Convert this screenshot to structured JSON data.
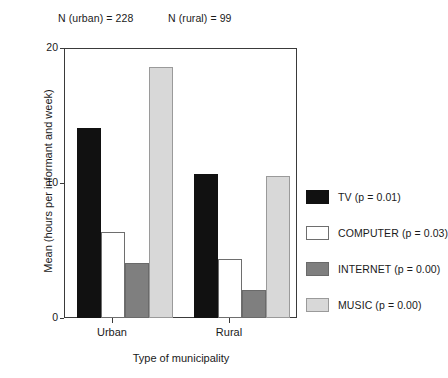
{
  "annotations": {
    "n_urban": "N (urban) = 228",
    "n_rural": "N (rural) = 99"
  },
  "axes": {
    "y_title": "Mean (hours per informant and week)",
    "x_title": "Type of municipality",
    "y_ticks": [
      "0",
      "10",
      "20"
    ],
    "x_ticks": [
      "Urban",
      "Rural"
    ]
  },
  "legend": {
    "items": [
      {
        "label": "TV (p = 0.01)",
        "color": "#111111",
        "key": "tv"
      },
      {
        "label": "COMPUTER (p = 0.03)",
        "color": "#ffffff",
        "key": "computer"
      },
      {
        "label": "INTERNET (p = 0.00)",
        "color": "#7f7f7f",
        "key": "internet"
      },
      {
        "label": "MUSIC (p = 0.00)",
        "color": "#d8d8d8",
        "key": "music"
      }
    ]
  },
  "chart_data": {
    "type": "bar",
    "title": "",
    "xlabel": "Type of municipality",
    "ylabel": "Mean (hours per informant and week)",
    "categories": [
      "Urban",
      "Rural"
    ],
    "ylim": [
      0,
      20
    ],
    "yticks": [
      0,
      10,
      20
    ],
    "grid": false,
    "legend_position": "right",
    "series": [
      {
        "name": "TV (p = 0.01)",
        "color": "#111111",
        "values": [
          14.1,
          10.7
        ]
      },
      {
        "name": "COMPUTER (p = 0.03)",
        "color": "#ffffff",
        "values": [
          6.4,
          4.4
        ]
      },
      {
        "name": "INTERNET (p = 0.00)",
        "color": "#7f7f7f",
        "values": [
          4.1,
          2.1
        ]
      },
      {
        "name": "MUSIC (p = 0.00)",
        "color": "#d8d8d8",
        "values": [
          18.6,
          10.5
        ]
      }
    ],
    "annotations": [
      "N (urban) = 228",
      "N (rural) = 99"
    ]
  },
  "layout": {
    "bar_width_px": 24,
    "group_left_px": [
      13,
      130
    ],
    "plot_height_px": 270
  }
}
